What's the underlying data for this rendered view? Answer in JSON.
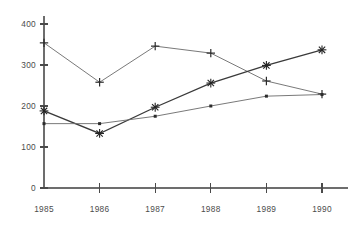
{
  "chart_data": {
    "type": "line",
    "title": "",
    "subtitle": "",
    "xlabel": "",
    "ylabel": "",
    "categories": [
      "1985",
      "1986",
      "1987",
      "1988",
      "1989",
      "1990"
    ],
    "x_tick_labels": [
      "1985",
      "1986",
      "1987",
      "1988",
      "1989",
      "1990"
    ],
    "y_tick_labels": [
      "0",
      "100",
      "200",
      "300",
      "400"
    ],
    "y_ticks": [
      0,
      100,
      200,
      300,
      400
    ],
    "ylim": [
      0,
      420
    ],
    "xlim": [
      "1985",
      "1990"
    ],
    "grid": false,
    "legend": "none",
    "series": [
      {
        "name": "series-1",
        "marker": "plus",
        "values": [
          354,
          258,
          346,
          329,
          261,
          229
        ]
      },
      {
        "name": "series-2",
        "marker": "star",
        "values": [
          188,
          133,
          197,
          256,
          299,
          337
        ]
      },
      {
        "name": "series-3",
        "marker": "dot",
        "values": [
          157,
          157,
          175,
          200,
          224,
          228
        ]
      }
    ]
  },
  "axes": {
    "y_axis_name": "y-axis",
    "x_axis_name": "x-axis"
  },
  "colors": {
    "axis": "#6d6d6d",
    "line": "#6a6a6a",
    "line_emphasis": "#3a3a3a",
    "marker": "#2b2b2b",
    "text": "#4b4b4b",
    "background": "#ffffff"
  }
}
